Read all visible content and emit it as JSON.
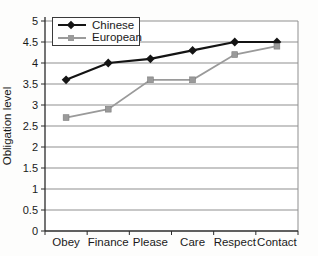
{
  "chart_data": {
    "type": "line",
    "title": "",
    "xlabel": "",
    "ylabel": "Obligation level",
    "categories": [
      "Obey",
      "Finance",
      "Please",
      "Care",
      "Respect",
      "Contact"
    ],
    "series": [
      {
        "name": "Chinese",
        "color": "#141414",
        "marker": "diamond",
        "line_width": 2.2,
        "values": [
          3.6,
          4.0,
          4.1,
          4.3,
          4.5,
          4.5
        ]
      },
      {
        "name": "European",
        "color": "#9a9a9a",
        "marker": "square",
        "line_width": 1.8,
        "values": [
          2.7,
          2.9,
          3.6,
          3.6,
          4.2,
          4.4
        ]
      }
    ],
    "ylim": [
      0,
      5
    ],
    "y_tick_step": 0.5,
    "y_tick_labels": [
      "0",
      "0.5",
      "1",
      "1.5",
      "2",
      "2.5",
      "3",
      "3.5",
      "4",
      "4.5",
      "5"
    ],
    "grid": true,
    "legend_position": "top-left",
    "colors": {
      "axis": "#2b2b2b",
      "grid": "#8f8f8f",
      "text": "#1a1a1a",
      "background": "#fdfdfc"
    }
  }
}
